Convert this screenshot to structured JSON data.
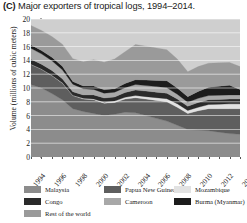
{
  "figure": {
    "panel_letter": "(C)",
    "title": "Major exporters of tropical logs, 1994–2014."
  },
  "axes": {
    "ylabel": "Volume (millions of cubic meters)",
    "yticks": [
      "0",
      "2",
      "4",
      "6",
      "8",
      "10",
      "12",
      "14",
      "16",
      "18",
      "20"
    ],
    "xticks": [
      "1994",
      "1996",
      "1998",
      "2000",
      "2002",
      "2004",
      "2006",
      "2008",
      "2010",
      "2012",
      "2014"
    ]
  },
  "legend": {
    "items": [
      {
        "label": "Malaysia",
        "color": "#8c8c8c"
      },
      {
        "label": "Papua New Guinea",
        "color": "#5e5e5e"
      },
      {
        "label": "Mozambique",
        "color": "#e2e2e2"
      },
      {
        "label": "Congo",
        "color": "#2a2a2a"
      },
      {
        "label": "Cameroon",
        "color": "#a8a8a8"
      },
      {
        "label": "Burma (Myanmar)",
        "color": "#1c1c1c"
      },
      {
        "label": "Rest of the world",
        "color": "#9a9a9a"
      }
    ]
  },
  "chart_data": {
    "type": "area",
    "stacked": true,
    "title": "Major exporters of tropical logs, 1994–2014.",
    "xlabel": "",
    "ylabel": "Volume (millions of cubic meters)",
    "xlim": [
      1994,
      2014
    ],
    "ylim": [
      0,
      20
    ],
    "grid": true,
    "legend_position": "below",
    "x": [
      1994,
      1995,
      1996,
      1997,
      1998,
      1999,
      2000,
      2001,
      2002,
      2003,
      2004,
      2005,
      2006,
      2007,
      2008,
      2009,
      2010,
      2011,
      2012,
      2013,
      2014
    ],
    "series": [
      {
        "name": "Malaysia",
        "color": "#8c8c8c",
        "values": [
          10.5,
          10.0,
          9.2,
          8.3,
          7.0,
          6.6,
          6.3,
          6.0,
          6.2,
          6.5,
          6.4,
          6.0,
          5.6,
          5.2,
          4.6,
          4.0,
          3.9,
          3.8,
          3.6,
          3.4,
          3.3
        ]
      },
      {
        "name": "Papua New Guinea",
        "color": "#5e5e5e",
        "values": [
          2.9,
          2.7,
          2.6,
          2.4,
          1.9,
          1.8,
          2.0,
          1.8,
          1.7,
          1.9,
          2.2,
          2.4,
          2.6,
          2.8,
          2.6,
          2.3,
          2.8,
          3.2,
          3.4,
          3.6,
          3.7
        ]
      },
      {
        "name": "Mozambique",
        "color": "#e2e2e2",
        "values": [
          0.05,
          0.05,
          0.05,
          0.05,
          0.05,
          0.1,
          0.1,
          0.15,
          0.2,
          0.25,
          0.3,
          0.35,
          0.4,
          0.45,
          0.5,
          0.45,
          0.5,
          0.6,
          0.65,
          0.7,
          0.7
        ]
      },
      {
        "name": "Congo",
        "color": "#2a2a2a",
        "values": [
          0.7,
          0.7,
          0.7,
          0.6,
          0.5,
          0.5,
          0.6,
          0.6,
          0.6,
          0.7,
          0.8,
          0.8,
          0.8,
          0.8,
          0.7,
          0.6,
          0.7,
          0.7,
          0.7,
          0.7,
          0.7
        ]
      },
      {
        "name": "Cameroon",
        "color": "#a8a8a8",
        "values": [
          1.6,
          1.5,
          1.4,
          1.3,
          1.1,
          0.9,
          0.8,
          0.7,
          0.7,
          0.7,
          0.8,
          0.8,
          0.8,
          0.8,
          0.7,
          0.6,
          0.6,
          0.6,
          0.6,
          0.6,
          0.6
        ]
      },
      {
        "name": "Burma (Myanmar)",
        "color": "#1c1c1c",
        "values": [
          0.5,
          0.5,
          0.5,
          0.5,
          0.4,
          0.4,
          0.5,
          0.5,
          0.5,
          0.6,
          0.7,
          0.8,
          0.9,
          1.0,
          0.9,
          0.8,
          1.0,
          1.2,
          1.3,
          1.4,
          0.8
        ]
      },
      {
        "name": "Rest of the world",
        "color": "#9a9a9a",
        "values": [
          2.8,
          2.9,
          3.0,
          3.2,
          3.3,
          3.5,
          3.8,
          4.0,
          4.3,
          4.6,
          5.1,
          4.9,
          4.7,
          4.5,
          4.2,
          3.6,
          3.6,
          3.5,
          3.4,
          3.3,
          3.3
        ]
      }
    ]
  }
}
